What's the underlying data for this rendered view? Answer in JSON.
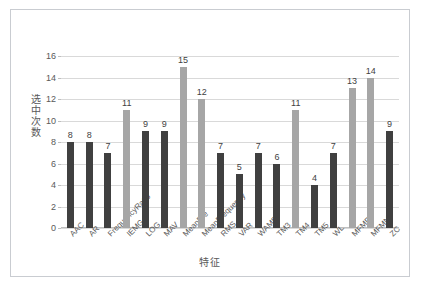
{
  "chart_data": {
    "type": "bar",
    "title": "",
    "xlabel": "特征",
    "ylabel": "选中次数",
    "ylim": [
      0,
      16
    ],
    "yticks": [
      0,
      2,
      4,
      6,
      8,
      10,
      12,
      14,
      16
    ],
    "grid": true,
    "legend": "none",
    "categories": [
      "AAC",
      "AR",
      "FrequencyRatio",
      "IEMG",
      "LOG",
      "MAV",
      "MeanFre",
      "MeanFrequency",
      "RMS",
      "VAR",
      "WAMP",
      "TM3",
      "TM4",
      "TM5",
      "WL",
      "MFMD",
      "MFMN",
      "ZC"
    ],
    "values": [
      8,
      8,
      7,
      11,
      9,
      9,
      15,
      12,
      7,
      5,
      7,
      6,
      11,
      4,
      7,
      13,
      14,
      9
    ],
    "bar_colors": [
      "#404040",
      "#404040",
      "#404040",
      "#a6a6a6",
      "#404040",
      "#404040",
      "#a6a6a6",
      "#a6a6a6",
      "#404040",
      "#404040",
      "#404040",
      "#404040",
      "#a6a6a6",
      "#404040",
      "#404040",
      "#a6a6a6",
      "#a6a6a6",
      "#404040"
    ],
    "colors": {
      "bar_dark": "#404040",
      "bar_light": "#a6a6a6",
      "gridline": "#d9d9d9",
      "axis_text": "#595959",
      "frame_border": "#c9ccd1",
      "background": "#ffffff"
    }
  },
  "artifacts": {
    "bleed_a": "",
    "bleed_b": ""
  }
}
